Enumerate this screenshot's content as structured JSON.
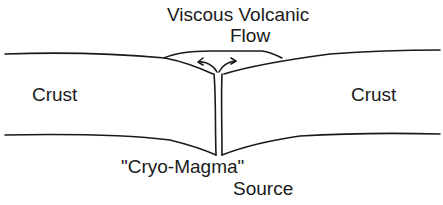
{
  "diagram": {
    "labels": {
      "flow_line1": "Viscous Volcanic",
      "flow_line2": "Flow",
      "crust_left": "Crust",
      "crust_right": "Crust",
      "source_line1": "\"Cryo-Magma\"",
      "source_line2": "Source"
    },
    "colors": {
      "line": "#1a1a1a",
      "background": "#ffffff"
    }
  }
}
